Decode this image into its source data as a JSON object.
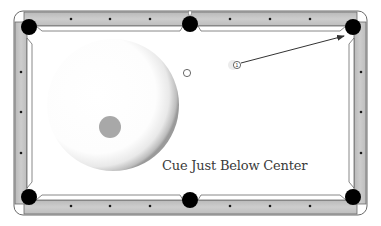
{
  "diagram": {
    "type": "pool-table-shot-diagram",
    "caption": "Cue Just Below Center",
    "object_ball_label": "1",
    "colors": {
      "rail": "#c4c4c4",
      "rail_edge": "#6a6a6a",
      "cloth": "#ffffff",
      "pocket": "#000000",
      "sight_dot": "#1a1a1a",
      "cue_tip_spot": "#a8a8a8",
      "arrow": "#333333",
      "caption": "#3a3a3a"
    },
    "pockets": [
      {
        "name": "top-left",
        "x": 29,
        "y": 27
      },
      {
        "name": "top-middle",
        "x": 190,
        "y": 24
      },
      {
        "name": "top-right",
        "x": 353,
        "y": 27
      },
      {
        "name": "bottom-left",
        "x": 29,
        "y": 197
      },
      {
        "name": "bottom-middle",
        "x": 190,
        "y": 200
      },
      {
        "name": "bottom-right",
        "x": 353,
        "y": 197
      }
    ],
    "cue_ball_contact_illustration": {
      "center_x": 113,
      "center_y": 105,
      "radius": 66,
      "tip_spot_x": 110,
      "tip_spot_y": 127,
      "tip_spot_radius": 11,
      "tip_position": "just below center"
    },
    "cue_ball": {
      "x": 187,
      "y": 73,
      "radius": 4
    },
    "object_ball": {
      "x": 237,
      "y": 65,
      "radius": 4,
      "number": "1"
    },
    "aim_arrow": {
      "from_x": 243,
      "from_y": 63,
      "to_x": 345,
      "to_y": 36,
      "target_pocket": "top-right"
    }
  }
}
